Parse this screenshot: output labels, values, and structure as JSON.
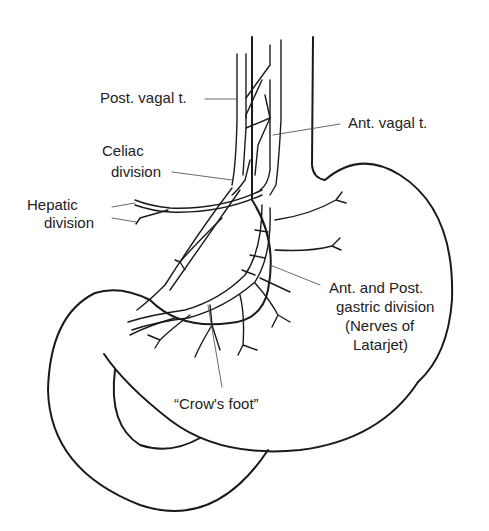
{
  "figure": {
    "labels": {
      "post_vagal": "Post. vagal t.",
      "ant_vagal": "Ant. vagal t.",
      "celiac_1": "Celiac",
      "celiac_2": "division",
      "hepatic_1": "Hepatic",
      "hepatic_2": "division",
      "gastric_1": "Ant. and Post.",
      "gastric_2": "gastric division",
      "gastric_3": "(Nerves of",
      "gastric_4": "Latarjet)",
      "crows_foot": "“Crow's foot”"
    },
    "colors": {
      "line": "#1a1a1a",
      "background": "#ffffff"
    }
  }
}
